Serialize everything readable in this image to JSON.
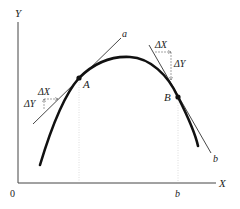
{
  "diagram": {
    "axes": {
      "y_label": "Y",
      "x_label": "X",
      "origin_label": "0",
      "x_tick_label": "b"
    },
    "points": {
      "A": "A",
      "B": "B"
    },
    "tangents": {
      "a": "a",
      "b": "b"
    },
    "increments": {
      "A_dx": "ΔX",
      "A_dy": "ΔY",
      "B_dx": "ΔX",
      "B_dy": "ΔY"
    },
    "colors": {
      "curve": "#111111",
      "axis": "#444444",
      "tangent": "#333333",
      "guide": "#cccccc"
    }
  }
}
